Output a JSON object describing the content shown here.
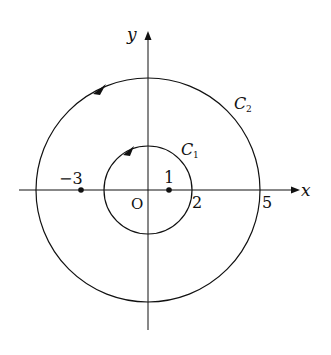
{
  "diagram": {
    "type": "complex-plane-contours",
    "axes": {
      "x_label": "x",
      "y_label": "y",
      "origin_label": "O"
    },
    "contours": [
      {
        "name": "C1",
        "label_main": "C",
        "label_sub": "1",
        "radius": 2,
        "center": [
          0,
          0
        ],
        "orientation": "counterclockwise"
      },
      {
        "name": "C2",
        "label_main": "C",
        "label_sub": "2",
        "radius": 5,
        "center": [
          0,
          0
        ],
        "orientation": "counterclockwise"
      }
    ],
    "points": [
      {
        "label": "−3",
        "x": -3,
        "y": 0
      },
      {
        "label": "1",
        "x": 1,
        "y": 0
      }
    ],
    "axis_marks": [
      {
        "label": "2",
        "x": 2
      },
      {
        "label": "5",
        "x": 5
      }
    ],
    "colors": {
      "stroke": "#111111",
      "background": "#ffffff"
    }
  }
}
